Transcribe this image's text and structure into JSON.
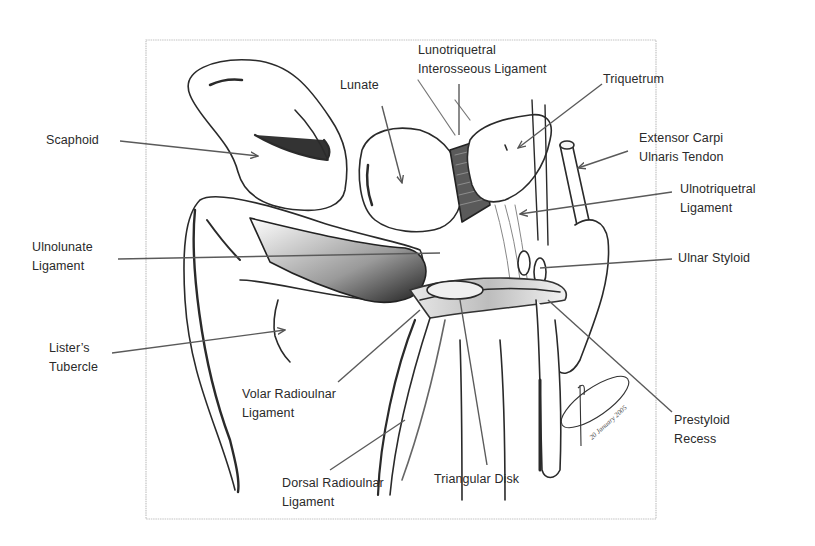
{
  "figure": {
    "border_color": "#bdbdbd",
    "line_color": "#555555",
    "text_color": "#2a2a2a"
  },
  "labels": {
    "scaphoid": {
      "lines": [
        "Scaphoid"
      ]
    },
    "lunate": {
      "lines": [
        "Lunate"
      ]
    },
    "lunotriquetral": {
      "lines": [
        "Lunotriquetral",
        "Interosseous Ligament"
      ]
    },
    "triquetrum": {
      "lines": [
        "Triquetrum"
      ]
    },
    "ecu": {
      "lines": [
        "Extensor Carpi",
        "Ulnaris Tendon"
      ]
    },
    "ulnotriquetral": {
      "lines": [
        "Ulnotriquetral",
        "Ligament"
      ]
    },
    "ulnolunate": {
      "lines": [
        "Ulnolunate",
        "Ligament"
      ]
    },
    "ulnar_styloid": {
      "lines": [
        "Ulnar Styloid"
      ]
    },
    "listers": {
      "lines": [
        "Lister’s",
        "Tubercle"
      ]
    },
    "volar_ru": {
      "lines": [
        "Volar Radioulnar",
        "Ligament"
      ]
    },
    "prestyloid": {
      "lines": [
        "Prestyloid",
        "Recess"
      ]
    },
    "dorsal_ru": {
      "lines": [
        "Dorsal Radioulnar",
        "Ligament"
      ]
    },
    "triangular_disk": {
      "lines": [
        "Triangular Disk"
      ]
    }
  },
  "signature": {
    "date_text": "20 January 2005"
  }
}
